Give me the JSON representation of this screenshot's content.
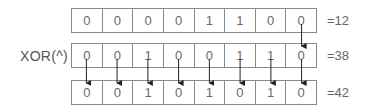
{
  "diagram": {
    "title": "",
    "operator_label": "XOR(^)",
    "rows": [
      {
        "bits": [
          "0",
          "0",
          "0",
          "0",
          "1",
          "1",
          "0",
          "0"
        ],
        "value_label": "=12"
      },
      {
        "bits": [
          "0",
          "0",
          "1",
          "0",
          "0",
          "1",
          "1",
          "0"
        ],
        "value_label": "=38"
      },
      {
        "bits": [
          "0",
          "0",
          "1",
          "0",
          "1",
          "0",
          "1",
          "0"
        ],
        "value_label": "=42"
      }
    ],
    "arrows": {
      "row1_to_row2_cells": [
        7
      ],
      "row2_to_row3_cells": [
        0,
        1,
        2,
        3,
        4,
        5,
        6,
        7
      ]
    },
    "colors": {
      "border": "#8a8a8a",
      "text": "#6a6a6a",
      "arrow": "#222222"
    }
  }
}
